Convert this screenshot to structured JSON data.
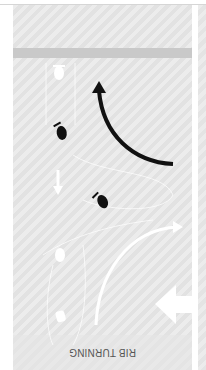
{
  "figure": {
    "caption": "RIB TURNING",
    "orientation": "rotated 180 degrees",
    "colors": {
      "background": "#e8e8e8",
      "band": "#c9c9c9",
      "black_arrow": "#111111",
      "white_elements": "#ffffff",
      "caption_text": "#555555"
    },
    "icons": {
      "boat_dark_1": "rib-boat-icon",
      "boat_dark_2": "rib-boat-icon",
      "boat_white_1": "rib-boat-outline-icon",
      "boat_white_2": "rib-boat-outline-icon",
      "black_arrow": "curved-arrow-icon",
      "white_arc_arrow": "curved-arrow-icon",
      "wind_arrow": "wind-arrow-icon",
      "small_arrow": "direction-arrow-icon"
    }
  }
}
